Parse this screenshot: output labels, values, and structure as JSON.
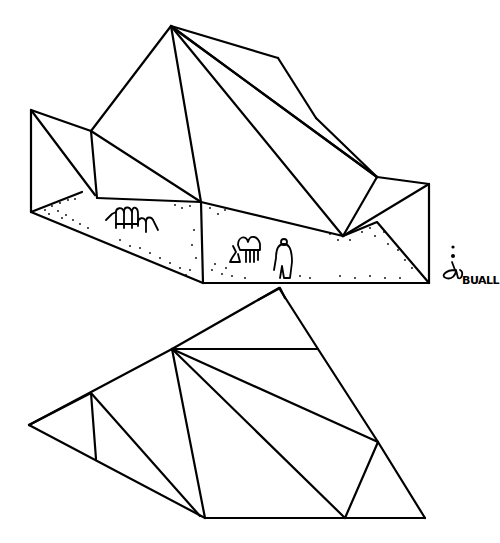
{
  "drawing": {
    "title": "Folded roof structure sketch",
    "views": [
      {
        "name": "perspective-view",
        "description": "Perspective of folded-plate roof over sandy ground with figures"
      },
      {
        "name": "plan-view",
        "description": "Triangulated plan of folded roof"
      }
    ],
    "stroke_color": "#000000",
    "background_color": "#ffffff"
  },
  "signature": {
    "text": "BUALL"
  }
}
